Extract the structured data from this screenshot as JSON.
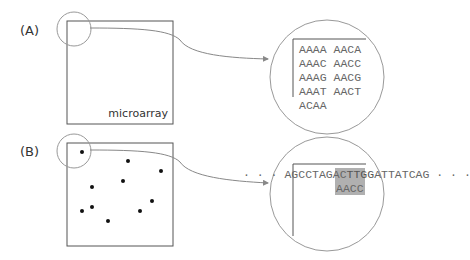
{
  "panels": [
    {
      "label": "(A)",
      "box_caption": "microarray",
      "zoom_rows": [
        "AAAA AACA",
        "AAAC AACC",
        "AAAG AACG",
        "AAAT AACT",
        "ACAA"
      ]
    },
    {
      "label": "(B)",
      "sequence_prefix": "· · · ",
      "sequence_before": "AGCCTAGAC",
      "sequence_highlight": "TTGG",
      "sequence_after": "ATTATCAG",
      "sequence_suffix": " · · ·",
      "probe": "AACC",
      "dots": [
        [
          82,
          152
        ],
        [
          128,
          161
        ],
        [
          161,
          171
        ],
        [
          123,
          181
        ],
        [
          92,
          187
        ],
        [
          152,
          201
        ],
        [
          92,
          207
        ],
        [
          82,
          211
        ],
        [
          140,
          211
        ],
        [
          108,
          221
        ]
      ]
    }
  ],
  "colors": {
    "line": "#555555",
    "circle": "#999999",
    "highlight": "#b0b0b0",
    "sequence_text": "#666666"
  }
}
